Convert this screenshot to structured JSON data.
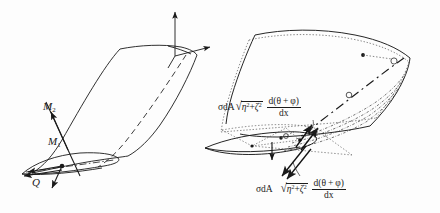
{
  "figure": {
    "name": "wing-torsion-moment-diagram",
    "background_color": "#fdfdfd",
    "ink_color": "#1a1a1a",
    "width": 440,
    "height": 213
  },
  "left_diagram": {
    "name": "wing-with-moment-resultants",
    "labels": {
      "m2": {
        "base": "M",
        "sub": "2"
      },
      "m1": {
        "base": "M",
        "sub": "1"
      },
      "q": {
        "base": "Q"
      }
    },
    "axes": {
      "vertical_arrow": "z-axis-arrow",
      "horizontal_arrow": "y-axis-arrow"
    }
  },
  "right_diagram": {
    "name": "wing-with-distributed-shear-stress",
    "formula_upper": {
      "lead": "σdA",
      "radical_sign": "√",
      "radical_body_base1": "η",
      "radical_body_sup1": "2",
      "radical_plus": "+",
      "radical_body_base2": "ζ",
      "radical_body_sup2": "2",
      "fraction_numerator": "d(θ + φ)",
      "fraction_denominator": "dx"
    },
    "formula_lower": {
      "lead": "σdA",
      "radical_sign": "√",
      "radical_body_base1": "η",
      "radical_body_sup1": "2",
      "radical_plus": "+",
      "radical_body_base2": "ζ",
      "radical_body_sup2": "2",
      "fraction_numerator": "d(θ + φ)",
      "fraction_denominator": "dx"
    }
  }
}
